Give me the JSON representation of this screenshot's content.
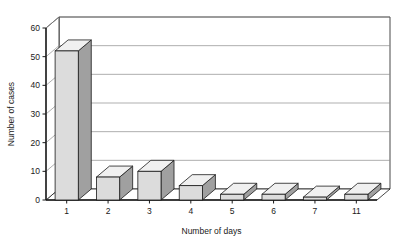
{
  "chart_data": {
    "type": "bar",
    "title": "",
    "subtitle": "",
    "xlabel": "Number of days",
    "ylabel": "Number of cases",
    "categories": [
      "1",
      "2",
      "3",
      "4",
      "5",
      "6",
      "7",
      "11"
    ],
    "values": [
      52,
      8,
      10,
      5,
      2,
      2,
      1,
      2
    ],
    "series": [
      {
        "name": "Number of cases",
        "values": [
          52,
          8,
          10,
          5,
          2,
          2,
          1,
          2
        ]
      }
    ],
    "ylim": [
      0,
      60
    ],
    "yticks": [
      0,
      10,
      20,
      30,
      40,
      50,
      60
    ],
    "ytick_labels": [
      "0",
      "10",
      "20",
      "30",
      "40",
      "50",
      "60"
    ],
    "grid": true,
    "grid_axis": "y",
    "legend": false,
    "legend_position": "none",
    "style": "3d-column",
    "colors": {
      "bar_front": "#DCDCDC",
      "bar_side": "#A0A0A0",
      "bar_top": "#F0F0F0",
      "bar_outline": "#1a1a1a",
      "grid": "#8c8c8c",
      "axis": "#1a1a1a",
      "floor": "#ffffff",
      "background": "#ffffff"
    }
  }
}
